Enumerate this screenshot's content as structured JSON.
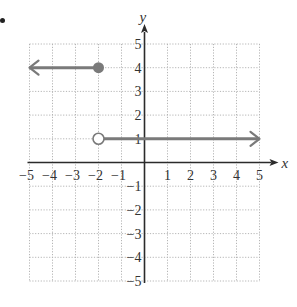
{
  "problem_marker": "•",
  "chart_data": {
    "type": "line",
    "title": "",
    "xlabel": "x",
    "ylabel": "y",
    "xlim": [
      -5,
      5
    ],
    "ylim": [
      -5,
      5
    ],
    "grid": true,
    "grid_style": "dotted",
    "xticks": [
      -5,
      -4,
      -3,
      -2,
      -1,
      1,
      2,
      3,
      4,
      5
    ],
    "yticks": [
      -5,
      -4,
      -3,
      -2,
      -1,
      1,
      2,
      3,
      4,
      5
    ],
    "xtick_labels": [
      "−5",
      "−4",
      "−3",
      "−2",
      "−1",
      "1",
      "2",
      "3",
      "4",
      "5"
    ],
    "ytick_labels": [
      "−5",
      "−4",
      "−3",
      "−2",
      "−1",
      "1",
      "2",
      "3",
      "4",
      "5"
    ],
    "series": [
      {
        "name": "piece-left",
        "description": "y = 4 for x ≤ −2",
        "x": [
          -5,
          -2
        ],
        "y": [
          4,
          4
        ],
        "start_marker": "arrow-left",
        "end_marker": "closed-circle",
        "endpoint": {
          "x": -2,
          "y": 4,
          "included": true
        }
      },
      {
        "name": "piece-right",
        "description": "y = 1 for x > −2",
        "x": [
          -2,
          5
        ],
        "y": [
          1,
          1
        ],
        "start_marker": "open-circle",
        "end_marker": "arrow-right",
        "endpoint": {
          "x": -2,
          "y": 1,
          "included": false
        }
      }
    ],
    "colors": {
      "line": "#7a7a7a",
      "axis": "#2b2b2b",
      "grid": "#b5b5b5",
      "text": "#333333"
    }
  }
}
